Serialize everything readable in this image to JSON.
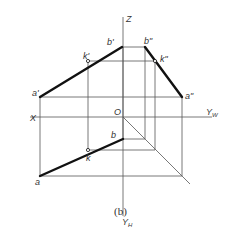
{
  "figure": {
    "caption": "(b)",
    "axes": {
      "x_label": "X",
      "z_label": "Z",
      "yw_label": "Y",
      "yw_sub": "W",
      "yh_label": "Y",
      "yh_sub": "H",
      "origin_label": "O"
    },
    "points": {
      "a_front": "a'",
      "b_front": "b'",
      "k_front": "k'",
      "a_side": "a\"",
      "b_side": "b\"",
      "k_side": "k\"",
      "a_top": "a",
      "b_top": "b",
      "k_top": "k"
    },
    "colors": {
      "line": "#555555",
      "segment": "#111111",
      "text": "#333333"
    }
  }
}
